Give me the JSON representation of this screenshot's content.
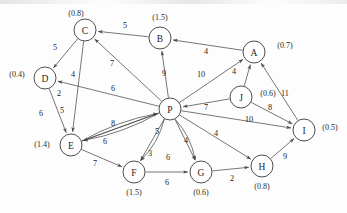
{
  "figure": {
    "kind": "directed-weighted-graph",
    "style": "scanned-textbook-figure",
    "node_radius": 11,
    "canvas": {
      "width": 347,
      "height": 213
    }
  },
  "chart_data": {
    "type": "diagram",
    "title": "",
    "nodes": [
      {
        "id": "C",
        "label": "C",
        "weight": "(0.8)",
        "x": 85,
        "y": 30,
        "wx": 76,
        "wy": 13
      },
      {
        "id": "B",
        "label": "B",
        "weight": "(1.5)",
        "x": 160,
        "y": 38,
        "wx": 160,
        "wy": 17
      },
      {
        "id": "A",
        "label": "A",
        "weight": "(0.7)",
        "x": 254,
        "y": 52,
        "wx": 285,
        "wy": 45
      },
      {
        "id": "D",
        "label": "D",
        "weight": "(0.4)",
        "x": 45,
        "y": 78,
        "wx": 17,
        "wy": 74
      },
      {
        "id": "J",
        "label": "J",
        "weight": "(0.6)",
        "x": 241,
        "y": 97,
        "wx": 268,
        "wy": 93
      },
      {
        "id": "P",
        "label": "P",
        "weight": "",
        "x": 170,
        "y": 109,
        "wx": 0,
        "wy": 0
      },
      {
        "id": "I",
        "label": "I",
        "weight": "(0.5)",
        "x": 304,
        "y": 130,
        "wx": 330,
        "wy": 127
      },
      {
        "id": "E",
        "label": "E",
        "weight": "(1.4)",
        "x": 71,
        "y": 145,
        "wx": 42,
        "wy": 144
      },
      {
        "id": "H",
        "label": "H",
        "weight": "(0.8)",
        "x": 262,
        "y": 166,
        "wx": 262,
        "wy": 186
      },
      {
        "id": "F",
        "label": "F",
        "weight": "(1.5)",
        "x": 134,
        "y": 172,
        "wx": 134,
        "wy": 192
      },
      {
        "id": "G",
        "label": "G",
        "weight": "(0.6)",
        "x": 201,
        "y": 172,
        "wx": 201,
        "wy": 192
      }
    ],
    "edges": [
      {
        "from": "C",
        "to": "D",
        "cost": "5",
        "lx": 55,
        "ly": 47
      },
      {
        "from": "C",
        "to": "E",
        "cost": "4",
        "lx": 73,
        "ly": 74
      },
      {
        "from": "B",
        "to": "C",
        "cost": "5",
        "lx": 125,
        "ly": 25
      },
      {
        "from": "A",
        "to": "B",
        "cost": "4",
        "lx": 206,
        "ly": 51
      },
      {
        "from": "P",
        "to": "C",
        "cost": "7",
        "lx": 112,
        "ly": 63
      },
      {
        "from": "P",
        "to": "D",
        "cost": "6",
        "lx": 113,
        "ly": 88
      },
      {
        "from": "P",
        "to": "B",
        "cost": "9",
        "lx": 164,
        "ly": 73
      },
      {
        "from": "P",
        "to": "A",
        "cost": "10",
        "lx": 201,
        "ly": 74
      },
      {
        "from": "J",
        "to": "A",
        "cost": "4",
        "lx": 234,
        "ly": 71
      },
      {
        "from": "J",
        "to": "P",
        "cost": "7",
        "lx": 206,
        "ly": 107
      },
      {
        "from": "J",
        "to": "I",
        "cost": "8",
        "lx": 270,
        "ly": 107
      },
      {
        "from": "I",
        "to": "A",
        "cost": "11",
        "lx": 285,
        "ly": 93
      },
      {
        "from": "P",
        "to": "I",
        "cost": "10",
        "lx": 249,
        "ly": 119
      },
      {
        "from": "P",
        "to": "H",
        "cost": "4",
        "lx": 216,
        "ly": 133
      },
      {
        "from": "P",
        "to": "G",
        "cost": "4",
        "lx": 186,
        "ly": 140
      },
      {
        "from": "P",
        "to": "E",
        "cost": "5",
        "lx": 62,
        "ly": 110
      },
      {
        "from": "P",
        "to": "E2",
        "cost": "2",
        "lx": 59,
        "ly": 93
      },
      {
        "from": "D",
        "to": "E",
        "cost": "6",
        "lx": 41,
        "ly": 113
      },
      {
        "from": "E",
        "to": "P",
        "cost": "8",
        "lx": 113,
        "ly": 123
      },
      {
        "from": "E",
        "to": "P2",
        "cost": "6",
        "lx": 105,
        "ly": 141
      },
      {
        "from": "E",
        "to": "F",
        "cost": "7",
        "lx": 95,
        "ly": 163
      },
      {
        "from": "P",
        "to": "F",
        "cost": "5",
        "lx": 157,
        "ly": 131
      },
      {
        "from": "P",
        "to": "F2",
        "cost": "3",
        "lx": 150,
        "ly": 153
      },
      {
        "from": "P",
        "to": "G2",
        "cost": "6",
        "lx": 168,
        "ly": 157
      },
      {
        "from": "F",
        "to": "G",
        "cost": "6",
        "lx": 167,
        "ly": 182
      },
      {
        "from": "G",
        "to": "H",
        "cost": "2",
        "lx": 232,
        "ly": 178
      },
      {
        "from": "H",
        "to": "I",
        "cost": "9",
        "lx": 285,
        "ly": 156
      }
    ]
  }
}
